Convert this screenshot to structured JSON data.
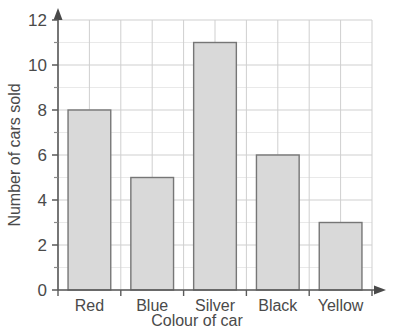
{
  "chart_data": {
    "type": "bar",
    "title": "",
    "categories": [
      "Red",
      "Blue",
      "Silver",
      "Black",
      "Yellow"
    ],
    "values": [
      8,
      5,
      11,
      6,
      3
    ],
    "xlabel": "Colour of car",
    "ylabel": "Number of cars sold",
    "ylim": [
      0,
      12
    ],
    "ytick_major": [
      0,
      2,
      4,
      6,
      8,
      10,
      12
    ],
    "ytick_major_labels": [
      "0",
      "2",
      "4",
      "6",
      "8",
      "10",
      "12"
    ],
    "ytick_minor": [
      1,
      3,
      5,
      7,
      9,
      11
    ],
    "grid": true,
    "legend": false,
    "bar_fill": "#d9d9d9",
    "bar_stroke": "#767676",
    "grid_color": "#cfcfcf",
    "axis_color": "#5a5a5a",
    "background": "#ffffff"
  },
  "axes": {
    "y_arrow": "up-arrow-icon",
    "x_arrow": "right-arrow-icon"
  }
}
